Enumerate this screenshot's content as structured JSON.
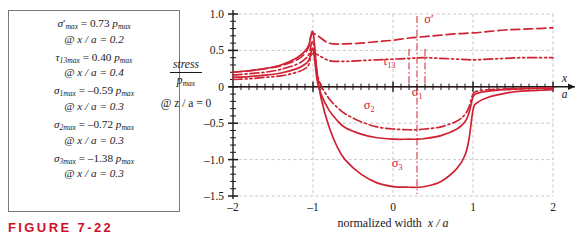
{
  "figure": {
    "caption": "FIGURE 7-22",
    "accent_color": "#cf2233",
    "grid_color": "#b9b9b9",
    "axis_color": "#1a1a1a"
  },
  "annotations": {
    "entries": [
      {
        "symbol": "σ",
        "prime": "′",
        "sub": "max",
        "value": "= 0.73",
        "unit": "p",
        "unit_sub": "max",
        "at": "@ x / a = 0.2"
      },
      {
        "symbol": "τ",
        "prime": "",
        "sub": "13max",
        "value": "= 0.40",
        "unit": "p",
        "unit_sub": "max",
        "at": "@ x / a = 0.4"
      },
      {
        "symbol": "σ",
        "prime": "",
        "sub": "1max",
        "value": "= –0.59",
        "unit": "p",
        "unit_sub": "max",
        "at": "@ x / a = 0.3"
      },
      {
        "symbol": "σ",
        "prime": "",
        "sub": "2max",
        "value": "= –0.72",
        "unit": "p",
        "unit_sub": "max",
        "at": "@ x / a = 0.3"
      },
      {
        "symbol": "σ",
        "prime": "",
        "sub": "3max",
        "value": "= –1.38",
        "unit": "p",
        "unit_sub": "max",
        "at": "@ x / a = 0.3"
      }
    ]
  },
  "ylabel": {
    "numerator": "stress",
    "denominator": "p",
    "denominator_sub": "max",
    "condition": "@ z / a = 0"
  },
  "xlabel": {
    "title": "normalized width",
    "title_var": "x / a",
    "arrow_numerator": "x",
    "arrow_denominator": "a"
  },
  "chart_data": {
    "type": "line",
    "title": "",
    "xlabel": "normalized width  x / a",
    "ylabel": "stress / p_max  @ z/a = 0",
    "xlim": [
      -2,
      2
    ],
    "ylim": [
      -1.5,
      1.0
    ],
    "grid": true,
    "legend": "inline-curve-labels",
    "xticks": [
      -2,
      -1,
      0,
      1,
      2
    ],
    "xtick_labels": [
      "–2",
      "–1",
      "0",
      "1",
      "2"
    ],
    "yticks": [
      -1.5,
      -1.0,
      -0.5,
      0,
      0.5,
      1.0
    ],
    "ytick_labels": [
      "–1.5",
      "–1.0",
      "–0.5",
      "0",
      "0.5",
      "1.0"
    ],
    "minor_tick_interval": 0.1,
    "markers": [
      {
        "x": 0.2,
        "label": "σ′ max location"
      },
      {
        "x": 0.3,
        "label": "σ 1,2,3 max location"
      },
      {
        "x": 0.4,
        "label": "τ 13 max location"
      }
    ],
    "series": [
      {
        "name": "σ′",
        "label": "σ′",
        "label_sub": "",
        "style": "dashed",
        "label_x": 0.45,
        "label_y": 0.87,
        "x": [
          -2.0,
          -1.8,
          -1.6,
          -1.4,
          -1.2,
          -1.1,
          -1.05,
          -1.0,
          -0.8,
          -0.6,
          -0.4,
          -0.2,
          0.0,
          0.2,
          0.4,
          0.6,
          0.8,
          1.0,
          1.2,
          1.4,
          1.6,
          1.8,
          2.0
        ],
        "y": [
          0.2,
          0.22,
          0.25,
          0.29,
          0.37,
          0.46,
          0.56,
          0.73,
          0.6,
          0.59,
          0.6,
          0.62,
          0.64,
          0.67,
          0.69,
          0.71,
          0.73,
          0.74,
          0.76,
          0.78,
          0.79,
          0.8,
          0.81
        ]
      },
      {
        "name": "τ_13",
        "label": "τ",
        "label_sub": "13",
        "style": "dashdotdot",
        "label_x": -0.05,
        "label_y": 0.3,
        "x": [
          -2.0,
          -1.8,
          -1.6,
          -1.4,
          -1.2,
          -1.1,
          -1.05,
          -1.0,
          -0.8,
          -0.6,
          -0.4,
          -0.2,
          0.0,
          0.2,
          0.4,
          0.6,
          0.8,
          1.0,
          1.2,
          1.4,
          1.6,
          1.8,
          2.0
        ],
        "y": [
          0.1,
          0.11,
          0.13,
          0.15,
          0.2,
          0.25,
          0.31,
          0.46,
          0.36,
          0.35,
          0.36,
          0.37,
          0.38,
          0.39,
          0.4,
          0.39,
          0.38,
          0.37,
          0.38,
          0.39,
          0.4,
          0.4,
          0.4
        ]
      },
      {
        "name": "σ_1",
        "label": "σ",
        "label_sub": "1",
        "style": "dashdot",
        "label_x": 0.3,
        "label_y": -0.12,
        "x": [
          -2.0,
          -1.8,
          -1.6,
          -1.4,
          -1.2,
          -1.1,
          -1.05,
          -1.0,
          -0.95,
          -0.9,
          -0.8,
          -0.7,
          -0.6,
          -0.4,
          -0.2,
          0.0,
          0.2,
          0.3,
          0.4,
          0.6,
          0.8,
          0.9,
          0.95,
          1.0,
          1.05,
          1.2,
          1.4,
          1.6,
          1.8,
          2.0
        ],
        "y": [
          0.16,
          0.18,
          0.2,
          0.24,
          0.31,
          0.38,
          0.45,
          0.62,
          0.2,
          0.02,
          -0.16,
          -0.28,
          -0.37,
          -0.48,
          -0.55,
          -0.58,
          -0.59,
          -0.59,
          -0.58,
          -0.55,
          -0.47,
          -0.38,
          -0.28,
          -0.1,
          -0.06,
          -0.04,
          -0.03,
          -0.02,
          -0.02,
          -0.01
        ]
      },
      {
        "name": "σ_2",
        "label": "σ",
        "label_sub": "2",
        "style": "solid",
        "label_x": -0.3,
        "label_y": -0.3,
        "x": [
          -2.0,
          -1.8,
          -1.6,
          -1.4,
          -1.2,
          -1.1,
          -1.05,
          -1.0,
          -0.95,
          -0.9,
          -0.8,
          -0.7,
          -0.6,
          -0.4,
          -0.2,
          0.0,
          0.2,
          0.3,
          0.4,
          0.6,
          0.8,
          0.9,
          0.95,
          1.0,
          1.05,
          1.2,
          1.4,
          1.6,
          1.8,
          2.0
        ],
        "y": [
          0.13,
          0.14,
          0.16,
          0.19,
          0.25,
          0.31,
          0.37,
          0.52,
          0.1,
          -0.1,
          -0.32,
          -0.46,
          -0.56,
          -0.65,
          -0.7,
          -0.72,
          -0.72,
          -0.72,
          -0.71,
          -0.67,
          -0.58,
          -0.48,
          -0.36,
          -0.14,
          -0.09,
          -0.06,
          -0.04,
          -0.03,
          -0.02,
          -0.02
        ]
      },
      {
        "name": "σ_3",
        "label": "σ",
        "label_sub": "3",
        "style": "solid",
        "label_x": 0.05,
        "label_y": -1.1,
        "x": [
          -2.0,
          -1.8,
          -1.6,
          -1.4,
          -1.2,
          -1.1,
          -1.05,
          -1.0,
          -0.95,
          -0.9,
          -0.8,
          -0.7,
          -0.6,
          -0.4,
          -0.2,
          0.0,
          0.2,
          0.3,
          0.4,
          0.6,
          0.8,
          0.9,
          0.95,
          1.0,
          1.05,
          1.2,
          1.4,
          1.6,
          1.8,
          2.0
        ],
        "y": [
          0.2,
          0.22,
          0.25,
          0.3,
          0.4,
          0.49,
          0.58,
          0.75,
          0.2,
          -0.15,
          -0.55,
          -0.82,
          -1.0,
          -1.2,
          -1.32,
          -1.37,
          -1.38,
          -1.38,
          -1.37,
          -1.3,
          -1.12,
          -0.94,
          -0.72,
          -0.32,
          -0.22,
          -0.14,
          -0.09,
          -0.06,
          -0.05,
          -0.04
        ]
      }
    ]
  }
}
